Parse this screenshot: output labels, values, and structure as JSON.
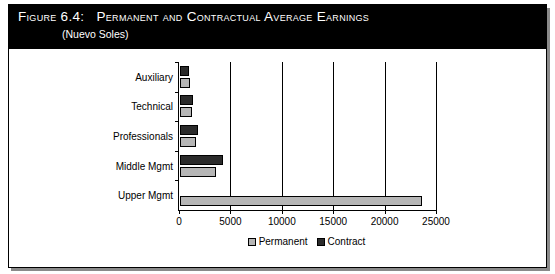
{
  "figure": {
    "label": "Figure 6.4:",
    "title": "Permanent and Contractual Average Earnings",
    "subtitle": "(Nuevo Soles)"
  },
  "colors": {
    "permanent": "#b6b6b6",
    "contract": "#2b2b2b",
    "title_background": "#000000",
    "title_text": "#ffffff",
    "frame": "#000000"
  },
  "legend": {
    "permanent_label": "Permanent",
    "contract_label": "Contract"
  },
  "axis": {
    "ticks": [
      "0",
      "5000",
      "10000",
      "15000",
      "20000",
      "25000"
    ]
  },
  "chart_data": {
    "type": "bar",
    "orientation": "horizontal",
    "subtitle": "(Nuevo Soles)",
    "xlabel": "",
    "ylabel": "",
    "xlim": [
      0,
      25000
    ],
    "xticks": [
      0,
      5000,
      10000,
      15000,
      20000,
      25000
    ],
    "grid": true,
    "grid_axis": "x",
    "legend_position": "bottom-center",
    "categories": [
      "Auxiliary",
      "Technical",
      "Professionals",
      "Middle Mgmt",
      "Upper Mgmt"
    ],
    "series": [
      {
        "name": "Contract",
        "values": [
          900,
          1250,
          1750,
          4150,
          0
        ]
      },
      {
        "name": "Permanent",
        "values": [
          1000,
          1150,
          1550,
          3500,
          23500
        ]
      }
    ]
  }
}
